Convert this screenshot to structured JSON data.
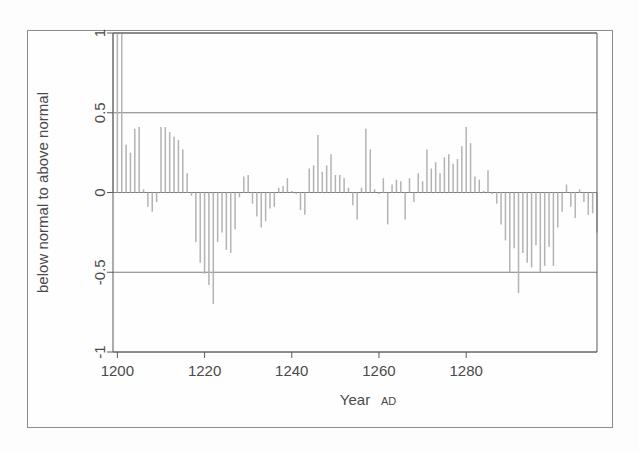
{
  "chart_data": {
    "type": "bar",
    "title": "",
    "subtitle": "",
    "xlabel": "Year AD",
    "xlabel_suffix": "AD",
    "xlabel_main": "Year",
    "ylabel": "below normal to above normal",
    "xlim": [
      1198,
      1300
    ],
    "ylim": [
      -1,
      1
    ],
    "yticks": [
      1,
      0.5,
      0,
      -0.5,
      -1
    ],
    "ytick_labels": [
      "1",
      "0.5",
      "0",
      "-0.5",
      "-1"
    ],
    "xticks": [
      1200,
      1220,
      1240,
      1260,
      1280
    ],
    "xtick_labels": [
      "1200",
      "1220",
      "1240",
      "1260",
      "1280"
    ],
    "grid": "horizontal-at-y-ticks",
    "legend": "none",
    "bar_color": "#b3b3b3",
    "axis_color": "#5a5a5a",
    "clipped_note": "first three bars exceed the top of the y-axis range (clipped at 1)",
    "x": [
      1199,
      1200,
      1201,
      1202,
      1203,
      1204,
      1205,
      1206,
      1207,
      1208,
      1209,
      1210,
      1211,
      1212,
      1213,
      1214,
      1215,
      1216,
      1217,
      1218,
      1219,
      1220,
      1221,
      1222,
      1223,
      1224,
      1225,
      1226,
      1227,
      1228,
      1229,
      1230,
      1231,
      1232,
      1233,
      1234,
      1235,
      1236,
      1237,
      1238,
      1239,
      1240,
      1241,
      1242,
      1243,
      1244,
      1245,
      1246,
      1247,
      1248,
      1249,
      1250,
      1251,
      1252,
      1253,
      1254,
      1255,
      1256,
      1257,
      1258,
      1259,
      1260,
      1261,
      1262,
      1263,
      1264,
      1265,
      1266,
      1267,
      1268,
      1269,
      1270,
      1271,
      1272,
      1273,
      1274,
      1275,
      1276,
      1277,
      1278,
      1279,
      1280,
      1281,
      1282,
      1283,
      1284,
      1285,
      1286,
      1287,
      1288,
      1289,
      1290,
      1291,
      1292,
      1293,
      1294,
      1295,
      1296,
      1297,
      1298
    ],
    "values": [
      1.0,
      1.0,
      1.0,
      0.3,
      0.25,
      0.4,
      0.41,
      0.02,
      -0.09,
      -0.12,
      -0.06,
      0.41,
      0.41,
      0.38,
      0.35,
      0.33,
      0.27,
      0.12,
      -0.02,
      -0.31,
      -0.44,
      -0.51,
      -0.58,
      -0.7,
      -0.31,
      -0.25,
      -0.36,
      -0.38,
      -0.23,
      -0.03,
      0.1,
      0.11,
      -0.07,
      -0.15,
      -0.22,
      -0.18,
      -0.1,
      -0.09,
      0.03,
      0.04,
      0.09,
      0.01,
      -0.01,
      -0.11,
      -0.14,
      0.15,
      0.17,
      0.36,
      0.13,
      0.17,
      0.24,
      0.11,
      0.11,
      0.09,
      0.03,
      -0.08,
      -0.17,
      0.03,
      0.4,
      0.27,
      0.02,
      -0.01,
      0.09,
      -0.2,
      0.05,
      0.08,
      0.07,
      -0.17,
      0.09,
      -0.06,
      0.12,
      0.07,
      0.27,
      0.15,
      0.19,
      0.12,
      0.22,
      0.24,
      0.18,
      0.21,
      0.29,
      0.41,
      0.31,
      0.1,
      0.08,
      0.01,
      0.14,
      -0.01,
      -0.07,
      -0.2,
      -0.3,
      -0.5,
      -0.35,
      -0.63,
      -0.38,
      -0.44,
      -0.47,
      -0.33,
      -0.5,
      -0.46
    ]
  },
  "chart_data_extended": {
    "note": "remaining bars beyond 1298 to the plot right edge",
    "x": [
      1299,
      1300,
      1301,
      1302,
      1303,
      1304,
      1305,
      1306,
      1307,
      1308,
      1309,
      1310
    ],
    "values": [
      -0.34,
      -0.46,
      -0.22,
      -0.12,
      0.05,
      -0.09,
      -0.16,
      0.02,
      -0.06,
      -0.14,
      -0.13,
      -0.25
    ]
  }
}
